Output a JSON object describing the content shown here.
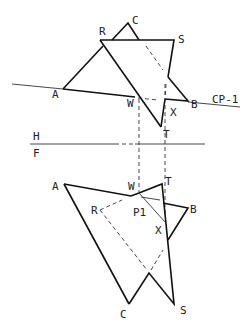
{
  "figure": {
    "type": "descriptive geometry – intersection of two planes (top & front views)",
    "cutting_plane_label": "CP-1",
    "fold_line": {
      "upper": "H",
      "lower": "F"
    }
  },
  "top_view": {
    "labels": {
      "A": "A",
      "B": "B",
      "C": "C",
      "R": "R",
      "S": "S",
      "T": "T",
      "W": "W",
      "X": "X"
    }
  },
  "front_view": {
    "labels": {
      "A": "A",
      "B": "B",
      "C": "C",
      "R": "R",
      "S": "S",
      "T": "T",
      "W": "W",
      "X": "X",
      "P1": "P1"
    }
  }
}
